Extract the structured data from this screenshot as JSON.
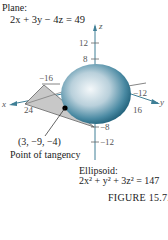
{
  "plane": {
    "label": "Plane:",
    "equation": "2x + 3y − 4z = 49"
  },
  "ellipsoid": {
    "label": "Ellipsoid:",
    "equation": "2x² + y² + 3z² = 147"
  },
  "tangency": {
    "coords": "(3, −9, −4)",
    "label": "Point of tangency"
  },
  "axes": {
    "x": {
      "name": "x",
      "ticks": [
        "−16",
        "24"
      ]
    },
    "y": {
      "name": "y",
      "ticks": [
        "−12",
        "16"
      ]
    },
    "z": {
      "name": "z",
      "ticks": [
        "12",
        "8",
        "−8",
        "−12"
      ]
    }
  },
  "figure": {
    "label": "FIGURE  15.72"
  },
  "colors": {
    "ellipsoid_dark": "#1f5f78",
    "ellipsoid_light": "#f4f8fa",
    "plane_fill": "#c8c8c8",
    "axis": "#3f7f96"
  }
}
